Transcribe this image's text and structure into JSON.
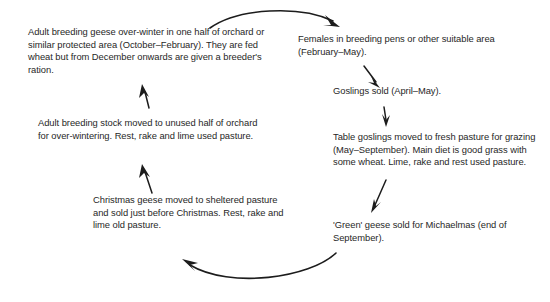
{
  "diagram": {
    "type": "cycle-flow-diagram",
    "text_color": "#272727",
    "arrow_color": "#1c1c1c",
    "background_color": "#ffffff",
    "nodes": [
      {
        "id": "overwinter",
        "text": "Adult breeding geese over-winter in one half of orchard or similar protected area (October–February). They are fed wheat but from December onwards are given a breeder's ration."
      },
      {
        "id": "females",
        "text": "Females in breeding pens or other suitable area (February–May)."
      },
      {
        "id": "goslings_sold",
        "text": "Goslings sold (April–May)."
      },
      {
        "id": "table_goslings",
        "text": "Table goslings moved to fresh pasture for grazing (May–September). Main diet is good grass with some wheat. Lime, rake and rest used pasture."
      },
      {
        "id": "green_geese",
        "text": "'Green' geese sold for Michaelmas (end of September)."
      },
      {
        "id": "christmas_geese",
        "text": "Christmas geese moved to sheltered pasture and sold just before Christmas. Rest, rake and lime old pasture."
      },
      {
        "id": "stock_moved",
        "text": "Adult breeding stock moved to unused half of orchard for over-wintering. Rest, rake and lime used pasture."
      }
    ],
    "arrows": [
      {
        "id": "arrow-overwinter-to-females",
        "shape": "curved",
        "direction": "left-to-right-over-top"
      },
      {
        "id": "arrow-females-to-goslings",
        "shape": "straight",
        "direction": "down-right"
      },
      {
        "id": "arrow-goslings-to-table",
        "shape": "straight",
        "direction": "down"
      },
      {
        "id": "arrow-table-to-green",
        "shape": "straight",
        "direction": "down-left"
      },
      {
        "id": "arrow-green-to-christmas",
        "shape": "curved",
        "direction": "right-to-left-under-bottom"
      },
      {
        "id": "arrow-christmas-to-stock-moved",
        "shape": "straight",
        "direction": "up"
      },
      {
        "id": "arrow-stock-moved-to-overwinter",
        "shape": "straight",
        "direction": "up"
      }
    ]
  }
}
